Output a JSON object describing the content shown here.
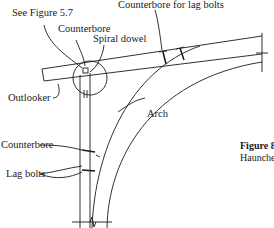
{
  "figure": {
    "labels": {
      "see_figure": "See Figure 5.7",
      "counterbore_top": "Counterbore",
      "spiral_dowel": "Spiral dowel",
      "counterbore_lag": "Counterbore for lag bolts",
      "outlooker": "Outlooker",
      "arch": "Arch",
      "counterbore_side": "Counterbore",
      "lag_bolts": "Lag bolts"
    },
    "caption": {
      "number": "Figure 8.5",
      "text_line1": "Out",
      "text_line2": "Haunched Arch"
    },
    "colors": {
      "line": "#1a1a1a",
      "background": "#ffffff"
    }
  }
}
